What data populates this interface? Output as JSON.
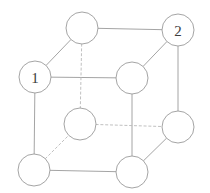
{
  "figure": {
    "width": 210,
    "height": 193,
    "background_color": "#ffffff",
    "node_radius": 16,
    "node_fill": "#ffffff",
    "node_stroke": "#9a9a9a",
    "edge_solid_color": "#9a9a9a",
    "edge_dashed_color": "#b9b9b9",
    "label_color": "#3c3c3c"
  },
  "chart_data": {
    "type": "diagram",
    "subtype": "graph",
    "nodes": [
      {
        "id": "back-top-left",
        "label": "",
        "x": 82,
        "y": 28,
        "r": 16
      },
      {
        "id": "back-top-right",
        "label": "2",
        "x": 178,
        "y": 30,
        "r": 16
      },
      {
        "id": "front-top-left",
        "label": "1",
        "x": 35,
        "y": 77,
        "r": 16
      },
      {
        "id": "front-top-right",
        "label": "",
        "x": 132,
        "y": 78,
        "r": 16
      },
      {
        "id": "back-bottom-left",
        "label": "",
        "x": 80,
        "y": 124,
        "r": 16
      },
      {
        "id": "back-bottom-right",
        "label": "",
        "x": 178,
        "y": 127,
        "r": 16
      },
      {
        "id": "front-bottom-left",
        "label": "",
        "x": 34,
        "y": 170,
        "r": 16
      },
      {
        "id": "front-bottom-right",
        "label": "",
        "x": 132,
        "y": 172,
        "r": 16
      }
    ],
    "edges": [
      {
        "from": "front-top-left",
        "to": "back-top-left",
        "style": "solid"
      },
      {
        "from": "back-top-left",
        "to": "back-top-right",
        "style": "solid"
      },
      {
        "from": "front-top-right",
        "to": "back-top-right",
        "style": "solid"
      },
      {
        "from": "front-top-left",
        "to": "front-top-right",
        "style": "solid"
      },
      {
        "from": "front-top-left",
        "to": "front-bottom-left",
        "style": "solid"
      },
      {
        "from": "front-top-right",
        "to": "front-bottom-right",
        "style": "solid"
      },
      {
        "from": "back-top-right",
        "to": "back-bottom-right",
        "style": "solid"
      },
      {
        "from": "front-bottom-left",
        "to": "front-bottom-right",
        "style": "solid"
      },
      {
        "from": "front-bottom-right",
        "to": "back-bottom-right",
        "style": "solid"
      },
      {
        "from": "back-top-left",
        "to": "back-bottom-left",
        "style": "dashed"
      },
      {
        "from": "back-bottom-left",
        "to": "back-bottom-right",
        "style": "dashed"
      },
      {
        "from": "front-bottom-left",
        "to": "back-bottom-left",
        "style": "dashed"
      }
    ],
    "labels": [
      {
        "node": "front-top-left",
        "text": "1"
      },
      {
        "node": "back-top-right",
        "text": "2"
      }
    ]
  }
}
